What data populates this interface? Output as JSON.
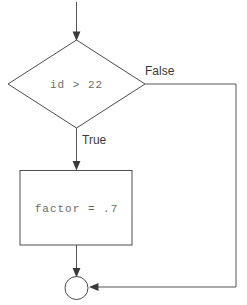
{
  "diagram": {
    "type": "flowchart",
    "title": "",
    "nodes": [
      {
        "id": "entry",
        "name": "entry-arrow",
        "shape": "arrow",
        "label": ""
      },
      {
        "id": "decision",
        "name": "decision-diamond",
        "shape": "diamond",
        "label": "id > 22"
      },
      {
        "id": "process",
        "name": "process-box",
        "shape": "rectangle",
        "label": "factor = .7"
      },
      {
        "id": "merge",
        "name": "merge-circle",
        "shape": "circle",
        "label": ""
      }
    ],
    "edges": [
      {
        "id": "edge-true",
        "name": "edge-true",
        "from": "decision",
        "to": "process",
        "label": "True"
      },
      {
        "id": "edge-false",
        "name": "edge-false",
        "from": "decision",
        "to": "merge",
        "label": "False"
      },
      {
        "id": "edge-process-merge",
        "name": "edge-process-merge",
        "from": "process",
        "to": "merge",
        "label": ""
      }
    ],
    "labels": {
      "decision_text": "id > 22",
      "process_text": "factor = .7",
      "true_label": "True",
      "false_label": "False"
    },
    "colors": {
      "background": "#ffffff",
      "shape_stroke": "#4d4d4d",
      "connector": "#555555",
      "arrow_head": "#3a3a3a",
      "mono_text": "#6b6b6b",
      "branch_label": "#3a3a3a"
    }
  }
}
